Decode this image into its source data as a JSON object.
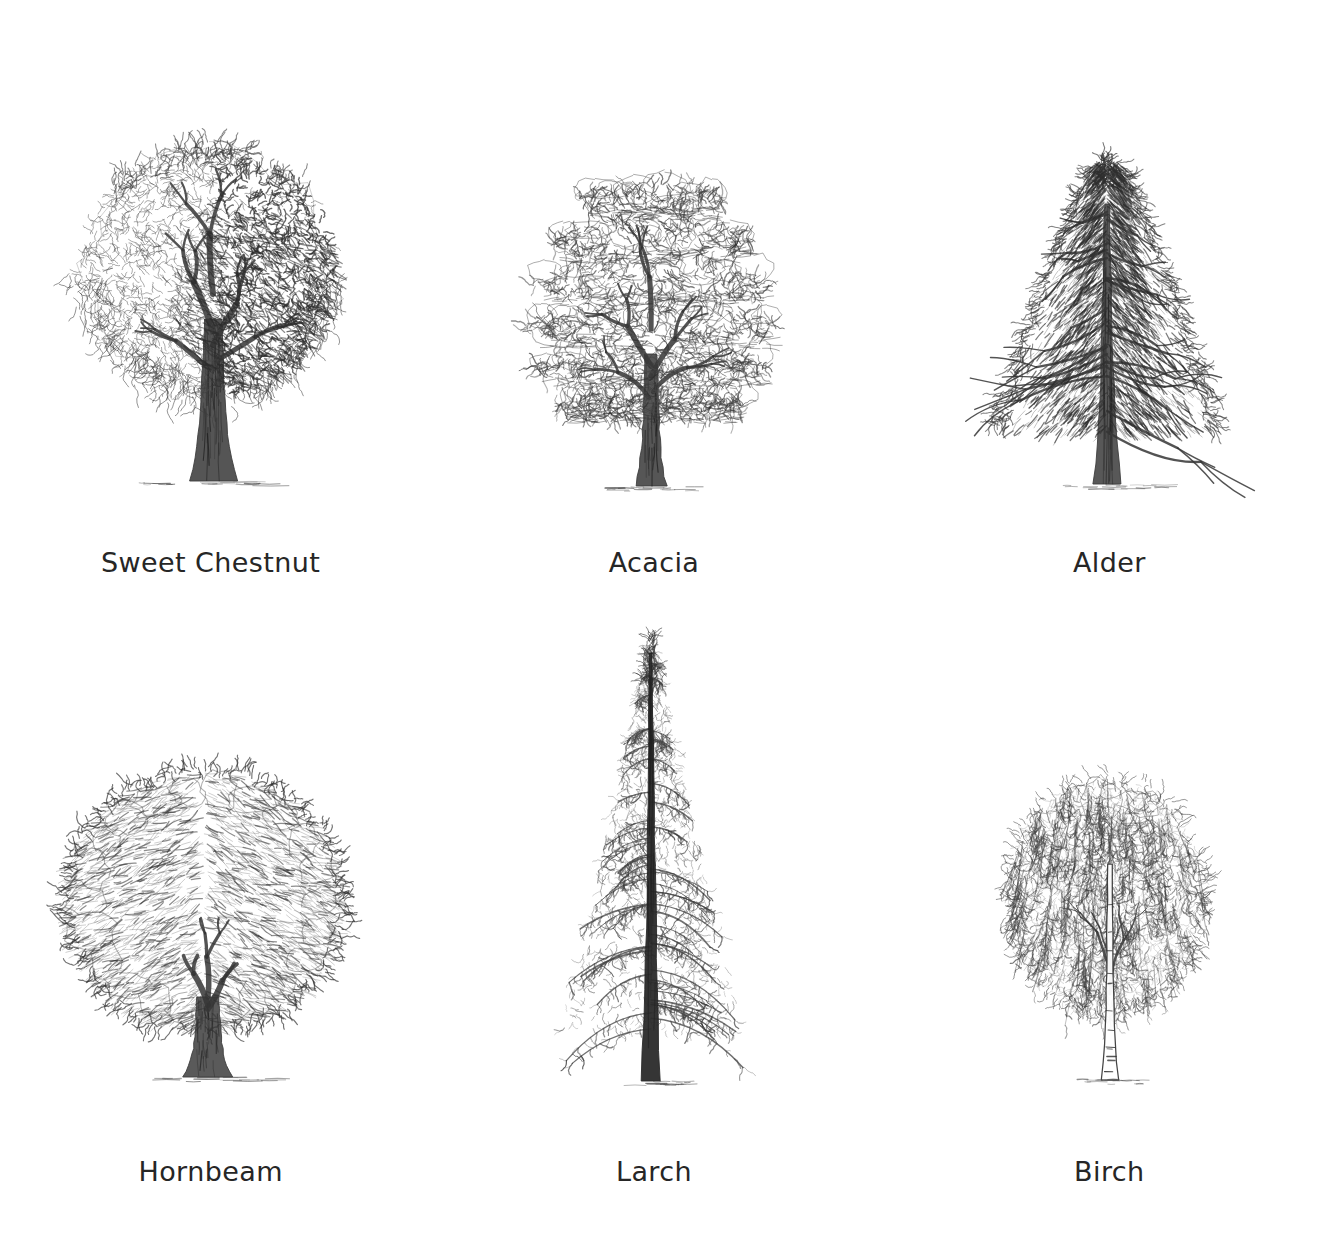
{
  "plate": {
    "background_color": "#ffffff",
    "ink_color": "#3a3a3a",
    "caption_color": "#262626",
    "medium": "graphite pencil sketch",
    "layout": "2 rows x 3 columns"
  },
  "trees": [
    {
      "id": "sweet-chestnut",
      "caption": "Sweet Chestnut",
      "row": 1,
      "column": 1,
      "form": "broad spreading dome",
      "foliage": "dense clustered leaf-masses, heavy shading on right side",
      "trunk": "thick dark striated trunk with flared base",
      "ground_shadow": true
    },
    {
      "id": "acacia",
      "caption": "Acacia",
      "row": 1,
      "column": 2,
      "form": "layered tiered crown",
      "foliage": "light open outline clusters in horizontal tiers",
      "trunk": "dark upright trunk forking into low branches",
      "ground_shadow": true
    },
    {
      "id": "alder",
      "caption": "Alder",
      "row": 1,
      "column": 3,
      "form": "narrow conical with pointed top",
      "foliage": "dense diagonal hatching in downswept tufts",
      "trunk": "straight central trunk running full height",
      "ground_shadow": true
    },
    {
      "id": "hornbeam",
      "caption": "Hornbeam",
      "row": 2,
      "column": 1,
      "form": "rounded dome, wider than tall",
      "foliage": "feathered wavy edge, fine flowing strokes",
      "trunk": "short thick fluted trunk",
      "ground_shadow": true
    },
    {
      "id": "larch",
      "caption": "Larch",
      "row": 2,
      "column": 2,
      "form": "tall narrow conifer spire",
      "foliage": "drooping tiered branches, open airy needles",
      "trunk": "slender very dark trunk visible to the apex",
      "ground_shadow": true
    },
    {
      "id": "birch",
      "caption": "Birch",
      "row": 2,
      "column": 3,
      "form": "upright oval with weeping crown",
      "foliage": "fine pendulous sprays, light tone",
      "trunk": "slender pale outlined trunk with horizontal bark bands",
      "ground_shadow": true
    }
  ]
}
